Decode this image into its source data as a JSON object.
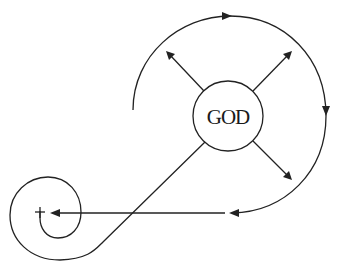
{
  "diagram": {
    "center_node": {
      "label": "GOD",
      "shape": "circle"
    },
    "start_marker": {
      "symbol": "+",
      "meaning": "cross / origin mark"
    },
    "elements": [
      {
        "type": "radial-arrow",
        "direction": "upper-left"
      },
      {
        "type": "radial-arrow",
        "direction": "upper-right"
      },
      {
        "type": "radial-arrow",
        "direction": "lower-right"
      },
      {
        "type": "connector",
        "direction": "lower-left",
        "to": "spiral"
      },
      {
        "type": "arc-path",
        "description": "clockwise arc around GOD from left, over top, down right side"
      },
      {
        "type": "horizontal-arrow",
        "description": "from bottom of arc leftward to the cross"
      },
      {
        "type": "spiral",
        "description": "spiral winding into the cross"
      }
    ],
    "colors": {
      "stroke": "#222222",
      "background": "#ffffff"
    }
  }
}
